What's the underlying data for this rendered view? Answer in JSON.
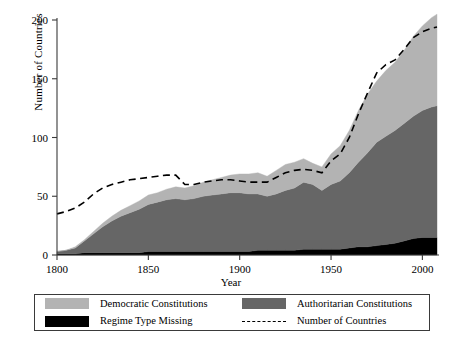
{
  "chart_data": {
    "type": "area",
    "title": "",
    "xlabel": "Year",
    "ylabel": "Number of Countries",
    "xlim": [
      1800,
      2008
    ],
    "ylim": [
      0,
      200
    ],
    "xticks": [
      1800,
      1850,
      1900,
      1950,
      2000
    ],
    "yticks": [
      0,
      50,
      100,
      150,
      200
    ],
    "grid": false,
    "stacked": true,
    "legend_position": "below-plot",
    "colors": {
      "democratic": "#b3b3b3",
      "authoritarian": "#666666",
      "missing": "#000000",
      "total_line": "#000000",
      "axis": "#3a3a3a"
    },
    "x": [
      1800,
      1805,
      1810,
      1815,
      1820,
      1825,
      1830,
      1835,
      1840,
      1845,
      1850,
      1855,
      1860,
      1865,
      1870,
      1875,
      1880,
      1885,
      1890,
      1895,
      1900,
      1905,
      1910,
      1915,
      1920,
      1925,
      1930,
      1935,
      1940,
      1945,
      1950,
      1955,
      1960,
      1965,
      1970,
      1975,
      1980,
      1985,
      1990,
      1995,
      2000,
      2005,
      2008
    ],
    "series": [
      {
        "name": "Regime Type Missing",
        "color": "#000000",
        "values": [
          1,
          1,
          1,
          2,
          2,
          2,
          2,
          2,
          2,
          2,
          3,
          3,
          3,
          3,
          3,
          3,
          3,
          3,
          3,
          3,
          3,
          3,
          4,
          4,
          4,
          4,
          4,
          5,
          5,
          5,
          5,
          5,
          6,
          7,
          7,
          8,
          9,
          10,
          12,
          14,
          15,
          15,
          15
        ]
      },
      {
        "name": "Authoritarian Constitutions",
        "color": "#666666",
        "values": [
          2,
          3,
          5,
          10,
          16,
          22,
          27,
          31,
          34,
          37,
          40,
          42,
          44,
          45,
          44,
          45,
          47,
          48,
          49,
          50,
          50,
          49,
          48,
          46,
          48,
          51,
          53,
          57,
          55,
          50,
          55,
          58,
          64,
          72,
          80,
          88,
          92,
          96,
          100,
          104,
          108,
          111,
          112
        ]
      },
      {
        "name": "Democratic Constitutions",
        "color": "#b3b3b3",
        "values": [
          0,
          0,
          1,
          1,
          2,
          3,
          4,
          5,
          6,
          7,
          8,
          8,
          9,
          10,
          10,
          11,
          12,
          13,
          14,
          15,
          16,
          17,
          18,
          17,
          20,
          22,
          22,
          20,
          18,
          20,
          26,
          30,
          36,
          44,
          50,
          52,
          56,
          58,
          62,
          68,
          72,
          76,
          78
        ]
      }
    ],
    "line_series": {
      "name": "Number of Countries",
      "style": "dashed",
      "color": "#000000",
      "values": [
        35,
        37,
        40,
        45,
        52,
        57,
        60,
        62,
        64,
        65,
        66,
        67,
        68,
        68,
        60,
        60,
        62,
        63,
        64,
        64,
        63,
        62,
        62,
        62,
        66,
        70,
        72,
        73,
        72,
        70,
        80,
        86,
        100,
        120,
        138,
        155,
        162,
        166,
        175,
        185,
        190,
        193,
        194
      ]
    }
  },
  "axes": {
    "y_tick_labels": [
      "0",
      "50",
      "100",
      "150",
      "200"
    ],
    "x_tick_labels": [
      "1800",
      "1850",
      "1900",
      "1950",
      "2000"
    ],
    "y_axis_title": "Number of Countries",
    "x_axis_title": "Year"
  },
  "legend": {
    "items": [
      {
        "label": "Democratic Constitutions",
        "swatch": "light-gray-swatch",
        "kind": "swatch"
      },
      {
        "label": "Authoritarian Constitutions",
        "swatch": "dark-gray-swatch",
        "kind": "swatch"
      },
      {
        "label": "Regime Type Missing",
        "swatch": "black-swatch",
        "kind": "swatch"
      },
      {
        "label": "Number of Countries",
        "swatch": "dashed-line-sample",
        "kind": "line"
      }
    ]
  }
}
